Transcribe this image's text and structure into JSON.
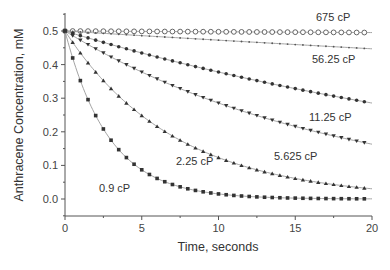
{
  "chart_data": {
    "type": "line",
    "title": "",
    "xlabel": "Time, seconds",
    "ylabel": "Anthracene Concentration, mM",
    "xlim": [
      0,
      20
    ],
    "ylim": [
      -0.05,
      0.55
    ],
    "x_ticks": [
      0,
      5,
      10,
      15,
      20
    ],
    "x_tick_labels": [
      "0",
      "5",
      "10",
      "15",
      "20"
    ],
    "y_ticks": [
      0.0,
      0.1,
      0.2,
      0.3,
      0.4,
      0.5
    ],
    "y_tick_labels": [
      "0.0",
      "0.1",
      "0.2",
      "0.3",
      "0.4",
      "0.5"
    ],
    "grid": false,
    "legend": "inline labels",
    "x": [
      0,
      0.5,
      1,
      1.5,
      2,
      2.5,
      3,
      3.5,
      4,
      4.5,
      5,
      5.5,
      6,
      6.5,
      7,
      7.5,
      8,
      8.5,
      9,
      9.5,
      10,
      10.5,
      11,
      11.5,
      12,
      12.5,
      13,
      13.5,
      14,
      14.5,
      15,
      15.5,
      16,
      16.5,
      17,
      17.5,
      18,
      18.5,
      19,
      19.5
    ],
    "series": [
      {
        "name": "675 cP",
        "marker": "open-circle",
        "initial": 0.5,
        "rate_constant": 0.00047,
        "values_at": {
          "0": 0.5,
          "5": 0.499,
          "10": 0.498,
          "15": 0.496,
          "20": 0.495
        },
        "label_pos": [
          316,
          21
        ]
      },
      {
        "name": "56.25 cP",
        "marker": "small-dot",
        "initial": 0.5,
        "rate_constant": 0.0056,
        "values_at": {
          "0": 0.5,
          "5": 0.486,
          "10": 0.473,
          "15": 0.459,
          "20": 0.447
        },
        "label_pos": [
          312,
          63
        ]
      },
      {
        "name": "11.25 cP",
        "marker": "filled-circle",
        "initial": 0.5,
        "rate_constant": 0.028,
        "values_at": {
          "0": 0.5,
          "5": 0.435,
          "10": 0.378,
          "15": 0.329,
          "20": 0.286
        },
        "label_pos": [
          309,
          121
        ]
      },
      {
        "name": "5.625 cP",
        "marker": "down-triangle",
        "initial": 0.5,
        "rate_constant": 0.056,
        "values_at": {
          "0": 0.5,
          "5": 0.378,
          "10": 0.286,
          "15": 0.216,
          "20": 0.163
        },
        "label_pos": [
          274,
          160
        ]
      },
      {
        "name": "2.25 cP",
        "marker": "up-triangle",
        "initial": 0.5,
        "rate_constant": 0.14,
        "values_at": {
          "0": 0.5,
          "5": 0.248,
          "10": 0.123,
          "15": 0.061,
          "20": 0.03
        },
        "label_pos": [
          176,
          165
        ]
      },
      {
        "name": "0.9 cP",
        "marker": "filled-square",
        "initial": 0.5,
        "rate_constant": 0.35,
        "values_at": {
          "0": 0.5,
          "5": 0.087,
          "10": 0.015,
          "15": 0.003,
          "20": 0.0005
        },
        "label_pos": [
          99,
          192
        ]
      }
    ]
  },
  "axes": {
    "xlabel": "Time, seconds",
    "ylabel": "Anthracene Concentration, mM"
  }
}
